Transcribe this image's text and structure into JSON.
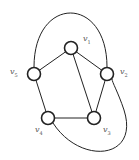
{
  "graph": {
    "stroke_color": "#222222",
    "label_color": "#555555",
    "nodes": [
      {
        "id": "v1",
        "name": "v",
        "sub": "1",
        "x": 71,
        "y": 48,
        "lx": 83,
        "ly": 35
      },
      {
        "id": "v2",
        "name": "v",
        "sub": "2",
        "x": 107,
        "y": 74,
        "lx": 120,
        "ly": 68
      },
      {
        "id": "v3",
        "name": "v",
        "sub": "3",
        "x": 94,
        "y": 118,
        "lx": 103,
        "ly": 126
      },
      {
        "id": "v4",
        "name": "v",
        "sub": "4",
        "x": 48,
        "y": 118,
        "lx": 35,
        "ly": 126
      },
      {
        "id": "v5",
        "name": "v",
        "sub": "5",
        "x": 34,
        "y": 74,
        "lx": 10,
        "ly": 68
      }
    ],
    "edges": [
      [
        "v1",
        "v5"
      ],
      [
        "v1",
        "v2"
      ],
      [
        "v1",
        "v3"
      ],
      [
        "v5",
        "v4"
      ],
      [
        "v4",
        "v3"
      ],
      [
        "v3",
        "v2"
      ]
    ],
    "curved_edges": [
      {
        "from": "v5",
        "to": "v2",
        "path": "M34,67 C34,-5 107,-5 107,67"
      },
      {
        "from": "v4",
        "to": "v2",
        "path": "M53,123 C80,165 140,160 124,110 C118,92 112,82 112,79"
      }
    ]
  }
}
